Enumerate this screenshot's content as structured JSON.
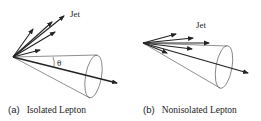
{
  "panels": [
    {
      "id": "a",
      "jet_label": "Jet",
      "angle_label": "θ",
      "caption_prefix": "(a)",
      "caption_text": "Isolated Lepton"
    },
    {
      "id": "b",
      "jet_label": "Jet",
      "caption_prefix": "(b)",
      "caption_text": "Nonisolated Lepton"
    }
  ],
  "colors": {
    "stroke": "#222222",
    "background": "#ffffff"
  }
}
